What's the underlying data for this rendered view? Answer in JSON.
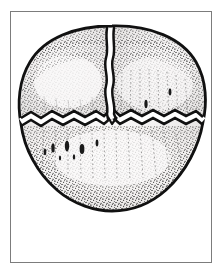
{
  "figure": {
    "medium": "pen-and-ink stipple illustration",
    "caption": "",
    "frame": {
      "visible": true,
      "border_color": "#7c7c7c",
      "border_width_px": 1,
      "x": 10,
      "y": 11,
      "width": 202,
      "height": 252,
      "background_color": "#ffffff"
    },
    "page_background_color": "#ffffff"
  },
  "specimen": {
    "name": "fossil-specimen",
    "description": "Broadly rounded, slightly ovate carapace outline drawn in heavy black line with dense stipple shading; a wavy vertical suture splits the upper half and a jagged zigzag fracture runs across the middle.",
    "outline_color": "#111111",
    "outline_width_px": 2.6,
    "fill_color": "#eceaea",
    "fill_color_light": "#f6f5f4",
    "stipple_color": "#2b2b2b",
    "bounds": {
      "x": 20,
      "y": 26,
      "width": 185,
      "height": 184
    },
    "parts": [
      {
        "id": "upper-left-lobe",
        "label": "Upper left lobe",
        "note": "Bounded above by outline, right by the vertical suture, below by the zigzag fracture."
      },
      {
        "id": "upper-right-lobe",
        "label": "Upper right lobe",
        "note": "Widest lobe; carries fine vertical stipple striations."
      },
      {
        "id": "lower-valve",
        "label": "Lower valve",
        "note": "Single broad lower section below the zigzag fracture, with a row of dark elongate tubercles."
      }
    ],
    "cracks": [
      {
        "id": "vertical-suture",
        "label": "Vertical suture",
        "style": "wavy double line, white gap between black edges",
        "from": {
          "x": 109,
          "y": 29
        },
        "to": {
          "x": 113,
          "y": 124
        }
      },
      {
        "id": "horizontal-fracture",
        "label": "Horizontal zigzag fracture",
        "style": "jagged zigzag double line, white gap between black edges",
        "from": {
          "x": 22,
          "y": 120
        },
        "to": {
          "x": 203,
          "y": 120
        }
      }
    ],
    "tubercles": {
      "label": "Dark elongate tubercles",
      "count": 7,
      "color": "#1a1a1a"
    },
    "striations": {
      "label": "Radial stipple striations",
      "color": "#3a3a3a"
    }
  },
  "colors": {
    "ink": "#111111",
    "stipple": "#2b2b2b",
    "shell_fill": "#eceaea",
    "shell_highlight": "#f8f7f6",
    "frame": "#7c7c7c",
    "paper": "#ffffff"
  }
}
